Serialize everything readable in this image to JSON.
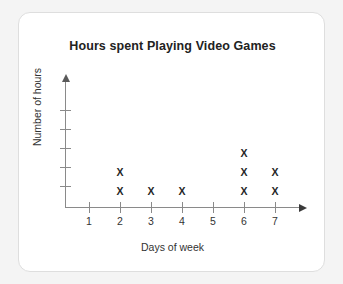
{
  "chart_data": {
    "type": "scatter",
    "title": "Hours spent Playing Video Games",
    "xlabel": "Days of week",
    "ylabel": "Number of hours",
    "marker": "X",
    "categories": [
      "1",
      "2",
      "3",
      "4",
      "5",
      "6",
      "7"
    ],
    "values": [
      0,
      2,
      1,
      1,
      0,
      3,
      2
    ],
    "xtick_labels": [
      "1",
      "2",
      "3",
      "4",
      "5",
      "6",
      "7"
    ],
    "ytick_labels": [
      "",
      "",
      "",
      "",
      ""
    ],
    "ytick_count": 5,
    "ylim": [
      0,
      5
    ],
    "xlim": [
      0,
      8
    ],
    "grid": false,
    "legend": false,
    "axis_arrows": true,
    "colors": {
      "marker": "#262626",
      "axis": "#8a8a8a",
      "text": "#333333",
      "title": "#222222",
      "card_background": "#ffffff",
      "card_border": "#dedede",
      "page_background": "#f4f4f4"
    }
  }
}
